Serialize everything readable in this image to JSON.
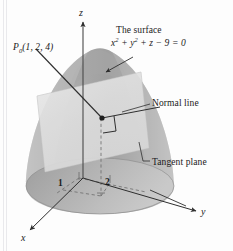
{
  "figure": {
    "caption_title": "The surface",
    "surface_equation": "x2 + y2 + z - 9 = 0",
    "surface_equation_parts": {
      "x": "x",
      "x_exp": "2",
      "plus1": " + ",
      "y": "y",
      "y_exp": "2",
      "plus2": " + ",
      "z": "z",
      "minus": " − 9 = 0"
    },
    "point_label": "P",
    "point_subscript": "0",
    "point_coords": "(1, 2, 4)",
    "normal_line_label": "Normal line",
    "tangent_plane_label": "Tangent plane",
    "axes": {
      "z": "z",
      "y": "y",
      "x": "x"
    },
    "ticks": {
      "x_tick": "1",
      "y_tick": "2"
    },
    "colors": {
      "background": "#fdfdfd",
      "surface_fill": "#b4b4b4",
      "surface_shadow": "#9a9a9a",
      "base_ellipse": "#a8a8a8",
      "tangent_plane_fill": "#d8d8d8",
      "line_stroke": "#3a3a3a",
      "dashed_stroke": "#6e6e6e",
      "text": "#1a1a1a"
    }
  }
}
